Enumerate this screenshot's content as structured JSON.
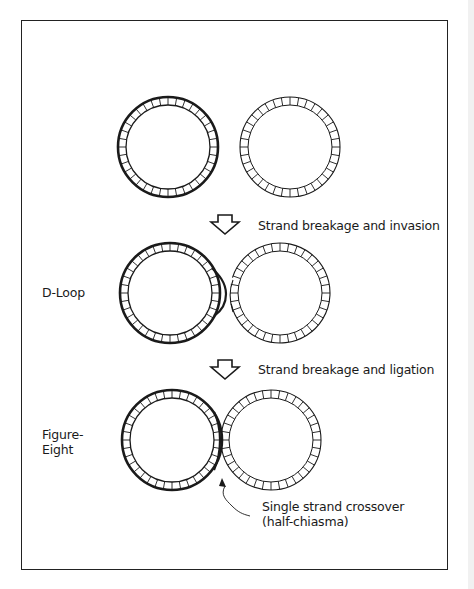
{
  "diagram": {
    "type": "recombination-stages",
    "stages": [
      {
        "id": "initial",
        "label": "",
        "description": "Two separate circular DNA molecules"
      },
      {
        "id": "d-loop",
        "label": "D-Loop"
      },
      {
        "id": "figure-eight",
        "label_line1": "Figure-",
        "label_line2": "Eight"
      }
    ],
    "steps": [
      {
        "arrow": "down-arrow",
        "label": "Strand breakage and invasion"
      },
      {
        "arrow": "down-arrow",
        "label": "Strand breakage and ligation"
      }
    ],
    "annotation": {
      "line1": "Single strand crossover",
      "line2": "(half-chiasma)"
    },
    "colors": {
      "stroke": "#1a1a1a",
      "background": "#ffffff"
    }
  }
}
